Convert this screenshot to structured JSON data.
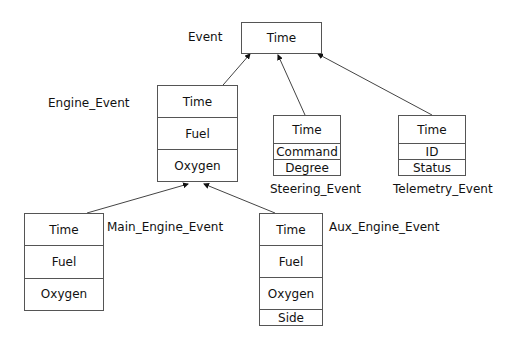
{
  "diagram": {
    "type": "class-hierarchy",
    "classes": [
      {
        "id": "event",
        "name": "Event",
        "fields": [
          "Time"
        ]
      },
      {
        "id": "engine_event",
        "name": "Engine_Event",
        "fields": [
          "Time",
          "Fuel",
          "Oxygen"
        ],
        "parent": "event"
      },
      {
        "id": "steering_event",
        "name": "Steering_Event",
        "fields": [
          "Time",
          "Command",
          "Degree"
        ],
        "parent": "event"
      },
      {
        "id": "telemetry_event",
        "name": "Telemetry_Event",
        "fields": [
          "Time",
          "ID",
          "Status"
        ],
        "parent": "event"
      },
      {
        "id": "main_engine_event",
        "name": "Main_Engine_Event",
        "fields": [
          "Time",
          "Fuel",
          "Oxygen"
        ],
        "parent": "engine_event"
      },
      {
        "id": "aux_engine_event",
        "name": "Aux_Engine_Event",
        "fields": [
          "Time",
          "Fuel",
          "Oxygen",
          "Side"
        ],
        "parent": "engine_event"
      }
    ]
  }
}
